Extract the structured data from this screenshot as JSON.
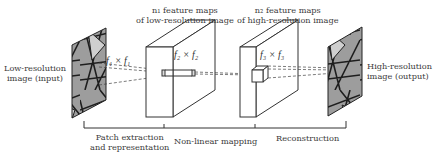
{
  "diagram": {
    "input": {
      "label_line1": "Low-resolution",
      "label_line2": "image (input)"
    },
    "output": {
      "label_line1": "High-resolution",
      "label_line2": "image (output)"
    },
    "layer1": {
      "title_line1": "n₁ feature maps",
      "title_line2": "of low-resolution image",
      "filter": "f₁ × f₁"
    },
    "layer2": {
      "title_line1": "n₂ feature maps",
      "title_line2": "of high-resolution image",
      "filter": "f₂ × f₂"
    },
    "layer3": {
      "filter": "f₃ × f₃"
    },
    "stages": [
      {
        "line1": "Patch extraction",
        "line2": "and representation"
      },
      {
        "line1": "Non-linear mapping"
      },
      {
        "line1": "Reconstruction"
      }
    ],
    "colors": {
      "line": "#333333",
      "image_dark": "#2a2a2a",
      "image_light": "#a8a8a8"
    }
  }
}
